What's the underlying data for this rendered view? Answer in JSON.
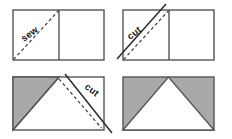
{
  "figure": {
    "background_color": "#ffffff",
    "outline_color": "#555555",
    "fill_gray": "#a9a9a9",
    "fill_white": "#ffffff",
    "line_color": "#2b2b2b",
    "width": 232,
    "height": 139
  },
  "panels": [
    {
      "id": "panel-1",
      "position": "top-left",
      "step": 1,
      "label": "sew",
      "label_rotation_deg": -37,
      "description": "Two squares side by side; dashed sew line across the left square from bottom-left corner to top-right corner of that square.",
      "rect": {
        "x": 13,
        "y": 10,
        "width": 91,
        "height": 50
      },
      "divider_x": 59,
      "sew_line": {
        "x1": 13,
        "y1": 60,
        "x2": 59,
        "y2": 10,
        "style": "dashed"
      },
      "cut_line": null,
      "shaded_regions": []
    },
    {
      "id": "panel-2",
      "position": "top-right",
      "step": 2,
      "label": "cut",
      "label_rotation_deg": -37,
      "description": "Same two squares; solid cut line parallel to and above the dashed sew line, extending past the square corners.",
      "rect": {
        "x": 123,
        "y": 10,
        "width": 91,
        "height": 50
      },
      "divider_x": 169,
      "sew_line": {
        "x1": 123,
        "y1": 60,
        "x2": 169,
        "y2": 10,
        "style": "dashed"
      },
      "cut_line": {
        "x1": 117,
        "y1": 59,
        "x2": 166,
        "y2": 4,
        "style": "solid"
      },
      "shaded_regions": []
    },
    {
      "id": "panel-3",
      "position": "bottom-left",
      "step": 3,
      "label": "cut",
      "label_rotation_deg": 37,
      "description": "Rectangle with gray triangle on the left (top-left, bottom-left, top-center apex) and white below; solid cut line from the top-center apex down to the bottom-right corner with a dashed sew line parallel below it.",
      "rect": {
        "x": 13,
        "y": 77,
        "width": 91,
        "height": 53
      },
      "divider_x": null,
      "sew_line": {
        "x1": 59,
        "y1": 79,
        "x2": 102,
        "y2": 128,
        "style": "dashed"
      },
      "cut_line": {
        "x1": 65,
        "y1": 74,
        "x2": 112,
        "y2": 133,
        "style": "solid"
      },
      "shaded_regions": [
        {
          "name": "gray-left-triangle",
          "points": "13,77 59,77 13,130",
          "fill": "#a9a9a9"
        }
      ]
    },
    {
      "id": "panel-4",
      "position": "bottom-right",
      "step": 4,
      "label": "",
      "label_rotation_deg": 0,
      "description": "Finished unit: gray rectangle with a white triangle whose base is the bottom edge and apex is the top-center point.",
      "rect": {
        "x": 123,
        "y": 77,
        "width": 91,
        "height": 53
      },
      "divider_x": null,
      "sew_line": null,
      "cut_line": null,
      "shaded_regions": [
        {
          "name": "gray-background",
          "points": "123,77 214,77 214,130 123,130",
          "fill": "#a9a9a9"
        },
        {
          "name": "white-center-triangle",
          "points": "123,130 168,77 214,130",
          "fill": "#ffffff"
        }
      ]
    }
  ],
  "labels": {
    "sew": "sew",
    "cut_top": "cut",
    "cut_bottom": "cut"
  }
}
